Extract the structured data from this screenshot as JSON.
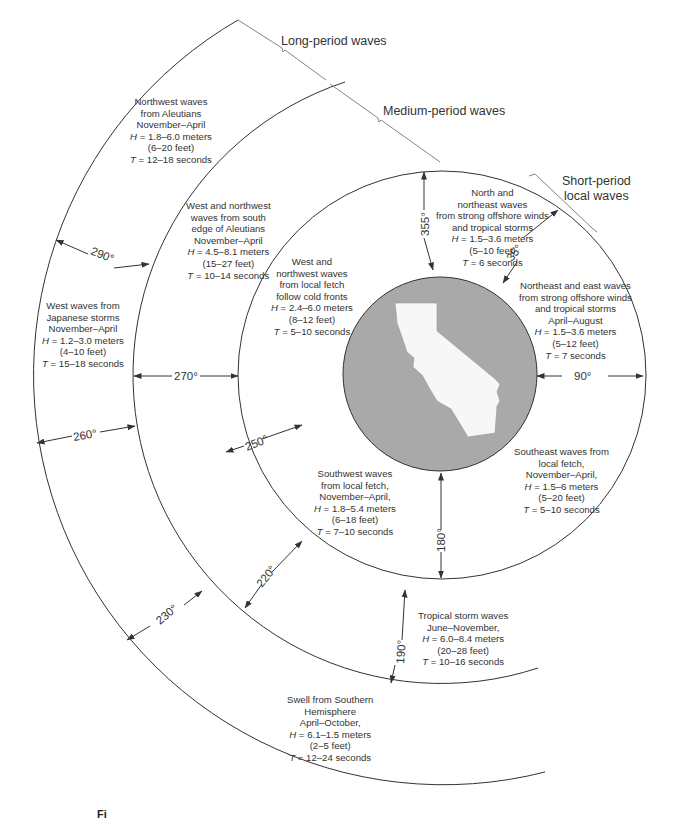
{
  "diagram": {
    "figure_label": "Fi",
    "colors": {
      "line": "#333333",
      "land": "#f7f7f7",
      "ocean_disc": "#a9a9a9"
    },
    "bands": {
      "long": {
        "label": "Long-period waves"
      },
      "medium": {
        "label": "Medium-period waves"
      },
      "short": {
        "label": "Short-period local waves",
        "line1": "Short-period",
        "line2": "local waves"
      }
    },
    "angles": {
      "a355": "355°",
      "a35": "35°",
      "a90": "90°",
      "a180": "180°",
      "a190": "190°",
      "a220": "220°",
      "a230": "230°",
      "a250": "250°",
      "a260": "260°",
      "a270": "270°",
      "a290": "290°"
    },
    "wave_groups": [
      {
        "id": "nw-aleutians",
        "lines": [
          "Northwest waves",
          "from Aleutians",
          "November–April"
        ],
        "H": "= 1.8–6.0 meters",
        "feet": "(6–20 feet)",
        "T": "= 12–18 seconds"
      },
      {
        "id": "w-japan",
        "lines": [
          "West waves from",
          "Japanese storms",
          "November–April"
        ],
        "H": "= 1.2–3.0 meters",
        "feet": "(4–10 feet)",
        "T": "= 15–18 seconds"
      },
      {
        "id": "wnw-south-aleutians",
        "lines": [
          "West and northwest",
          "waves from south",
          "edge of Aleutians",
          "November–April"
        ],
        "H": "= 4.5–8.1 meters",
        "feet": "(15–27 feet)",
        "T": "= 10–14 seconds"
      },
      {
        "id": "wnw-local",
        "lines": [
          "West and",
          "northwest waves",
          "from local fetch",
          "follow cold fronts"
        ],
        "H": "= 2.4–6.0 meters",
        "feet": "(8–12 feet)",
        "T": "= 5–10 seconds"
      },
      {
        "id": "n-ne",
        "lines": [
          "North and",
          "northeast waves",
          "from strong offshore winds",
          "and tropical storms"
        ],
        "H": "= 1.5–3.6 meters",
        "feet": "(5–10 feet)",
        "T": "= 6 seconds"
      },
      {
        "id": "ne-e",
        "lines": [
          "Northeast and east waves",
          "from strong offshore winds",
          "and tropical storms",
          "April–August"
        ],
        "H": "= 1.5–3.6 meters",
        "feet": "(5–12 feet)",
        "T": "= 7 seconds"
      },
      {
        "id": "se-local",
        "lines": [
          "Southeast waves from",
          "local fetch,",
          "November–April,"
        ],
        "H": "= 1.5–6 meters",
        "feet": "(5–20 feet)",
        "T": "= 5–10 seconds"
      },
      {
        "id": "sw-local",
        "lines": [
          "Southwest waves",
          "from local fetch,",
          "November–April,"
        ],
        "H": "= 1.8–5.4 meters",
        "feet": "(6–18 feet)",
        "T": "= 7–10 seconds"
      },
      {
        "id": "tropical",
        "lines": [
          "Tropical storm waves",
          "June–November,"
        ],
        "H": "= 6.0–8.4 meters",
        "feet": "(20–28 feet)",
        "T": "= 10–16 seconds"
      },
      {
        "id": "southern-swell",
        "lines": [
          "Swell from Southern",
          "Hemisphere",
          "April–October,"
        ],
        "H": "= 6.1–1.5 meters",
        "feet": "(2–5 feet)",
        "T": "= 12–24 seconds"
      }
    ],
    "symbols": {
      "H": "H",
      "T": "T"
    }
  }
}
